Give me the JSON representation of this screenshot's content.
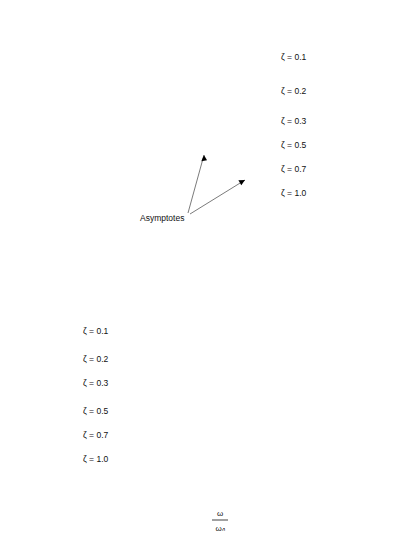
{
  "figure": {
    "kind": "bode-plot",
    "background_color": "#ffffff",
    "curve_color": "#000000",
    "grid_color": "#5a5a5a",
    "frame_color": "#1a1a1a"
  },
  "magnitude_axis": {
    "label": "db",
    "tick_labels": [
      "20",
      "10",
      "0",
      "-10"
    ],
    "tick_values": [
      20,
      10,
      0,
      -10
    ],
    "grid_values": [
      20,
      15,
      10,
      5,
      0,
      -5,
      -10,
      -15,
      -20
    ],
    "range": [
      -20,
      20
    ]
  },
  "phase_axis": {
    "label": "ϕ",
    "tick_labels": [
      "0°",
      "-90°",
      "-180°"
    ],
    "tick_values": [
      0,
      -90,
      -180
    ],
    "grid_values": [
      0,
      -30,
      -60,
      -90,
      -120,
      -150,
      -180,
      -210
    ],
    "range": [
      -270,
      0
    ]
  },
  "x_axis": {
    "title_numerator": "ω",
    "title_denominator": "ωₙ",
    "tick_labels": [
      "0.1",
      "0.2",
      "0.4",
      "0.6",
      "0.8",
      "1",
      "2",
      "4",
      "6",
      "8",
      "10"
    ],
    "tick_values": [
      0.1,
      0.2,
      0.4,
      0.6,
      0.8,
      1,
      2,
      4,
      6,
      8,
      10
    ],
    "grid_values": [
      0.1,
      0.2,
      0.4,
      0.6,
      0.8,
      1,
      2,
      4,
      6,
      8,
      10
    ],
    "range": [
      0.1,
      10
    ],
    "scale": "log"
  },
  "magnitude_legend": [
    {
      "label": "ζ = 0.1",
      "zeta": 0.1
    },
    {
      "label": "ζ = 0.2",
      "zeta": 0.2
    },
    {
      "label": "ζ = 0.3",
      "zeta": 0.3
    },
    {
      "label": "ζ = 0.5",
      "zeta": 0.5
    },
    {
      "label": "ζ = 0.7",
      "zeta": 0.7
    },
    {
      "label": "ζ = 1.0",
      "zeta": 1.0
    }
  ],
  "phase_legend": [
    {
      "label": "ζ = 0.1",
      "zeta": 0.1
    },
    {
      "label": "ζ = 0.2",
      "zeta": 0.2
    },
    {
      "label": "ζ = 0.3",
      "zeta": 0.3
    },
    {
      "label": "ζ = 0.5",
      "zeta": 0.5
    },
    {
      "label": "ζ = 0.7",
      "zeta": 0.7
    },
    {
      "label": "ζ = 1.0",
      "zeta": 1.0
    }
  ],
  "annotations": {
    "asymptotes_label": "Asymptotes"
  },
  "chart_data": {
    "type": "line",
    "title": "",
    "subtitle": "",
    "xlabel": "ω/ωₙ",
    "ylabel": "db",
    "xscale": "log",
    "xlim": [
      0.1,
      10
    ],
    "grid": true,
    "legend_position": "inside-right",
    "panels": [
      {
        "name": "magnitude",
        "ylabel": "db",
        "ylim": [
          -20,
          20
        ],
        "yticks": [
          20,
          10,
          0,
          -10
        ],
        "ygrid": [
          20,
          15,
          10,
          5,
          0,
          -5,
          -10,
          -15,
          -20
        ],
        "x": [
          0.1,
          0.15,
          0.2,
          0.3,
          0.4,
          0.5,
          0.6,
          0.7,
          0.8,
          0.9,
          0.95,
          1.0,
          1.05,
          1.1,
          1.2,
          1.4,
          1.6,
          2.0,
          2.5,
          3.0,
          4.0,
          5.0,
          6.0,
          8.0,
          10.0
        ],
        "series": [
          {
            "name": "ζ = 0.1",
            "zeta": 0.1,
            "peak_db": 14.0,
            "peak_x": 0.99,
            "values": [
              0.09,
              0.2,
              0.35,
              0.86,
              1.6,
              2.6,
              4.1,
              6.4,
              9.5,
              13.2,
              14.0,
              13.98,
              13.0,
              11.4,
              8.2,
              4.0,
              1.1,
              -3.3,
              -7.6,
              -10.7,
              -15.2,
              -18.4,
              -20.9,
              -24.5,
              -27.2
            ]
          },
          {
            "name": "ζ = 0.2",
            "zeta": 0.2,
            "peak_db": 8.1,
            "peak_x": 0.96,
            "values": [
              0.08,
              0.19,
              0.33,
              0.8,
              1.5,
              2.4,
              3.6,
              5.2,
              6.9,
              7.9,
              8.1,
              7.96,
              7.5,
              6.8,
              5.3,
              2.6,
              0.3,
              -3.6,
              -7.7,
              -10.7,
              -15.2,
              -18.4,
              -20.8,
              -24.5,
              -27.2
            ]
          },
          {
            "name": "ζ = 0.3",
            "zeta": 0.3,
            "peak_db": 4.8,
            "peak_x": 0.91,
            "values": [
              0.07,
              0.17,
              0.3,
              0.73,
              1.35,
              2.1,
              3.0,
              4.0,
              4.6,
              4.8,
              4.75,
              4.44,
              4.0,
              3.5,
              2.4,
              0.4,
              -1.5,
              -5.0,
              -8.5,
              -11.3,
              -15.6,
              -18.7,
              -21.1,
              -24.6,
              -27.3
            ]
          },
          {
            "name": "ζ = 0.5",
            "zeta": 0.5,
            "peak_db": 1.25,
            "peak_x": 0.71,
            "values": [
              0.04,
              0.11,
              0.2,
              0.5,
              0.9,
              1.1,
              1.25,
              1.2,
              1.0,
              0.6,
              0.35,
              0.0,
              -0.4,
              -0.9,
              -1.9,
              -3.8,
              -5.6,
              -8.6,
              -11.6,
              -14.0,
              -17.8,
              -20.7,
              -23.0,
              -26.3,
              -28.9
            ]
          },
          {
            "name": "ζ = 0.7",
            "zeta": 0.7,
            "peak_db": 0.0,
            "peak_x": 0.1,
            "values": [
              0.0,
              0.0,
              -0.02,
              -0.1,
              -0.25,
              -0.5,
              -0.85,
              -1.3,
              -1.9,
              -2.6,
              -2.9,
              -3.1,
              -3.5,
              -4.0,
              -4.9,
              -6.7,
              -8.3,
              -11.1,
              -13.9,
              -16.2,
              -19.8,
              -22.6,
              -24.9,
              -28.1,
              -30.7
            ]
          },
          {
            "name": "ζ = 1.0",
            "zeta": 1.0,
            "peak_db": 0.0,
            "peak_x": 0.1,
            "values": [
              -0.09,
              -0.19,
              -0.34,
              -0.75,
              -1.3,
              -1.9,
              -2.7,
              -3.5,
              -4.3,
              -5.2,
              -5.6,
              -6.0,
              -6.4,
              -6.9,
              -7.8,
              -9.6,
              -11.2,
              -13.9,
              -16.6,
              -18.8,
              -22.3,
              -25.0,
              -27.2,
              -30.4,
              -32.9
            ]
          }
        ],
        "asymptotes": [
          {
            "name": "low-frequency-asymptote",
            "points": [
              [
                0.1,
                0
              ],
              [
                1.0,
                0
              ]
            ],
            "slope_db_per_decade": 0
          },
          {
            "name": "high-frequency-asymptote",
            "points": [
              [
                1.0,
                0
              ],
              [
                10.0,
                -40
              ]
            ],
            "slope_db_per_decade": -40
          }
        ],
        "annotation": "Asymptotes"
      },
      {
        "name": "phase",
        "ylabel": "ϕ",
        "ylim": [
          -270,
          0
        ],
        "yticks": [
          0,
          -90,
          -180
        ],
        "ygrid": [
          0,
          -30,
          -60,
          -90,
          -120,
          -150,
          -180,
          -210
        ],
        "x": [
          0.1,
          0.15,
          0.2,
          0.3,
          0.4,
          0.5,
          0.6,
          0.7,
          0.8,
          0.9,
          0.95,
          1.0,
          1.05,
          1.1,
          1.2,
          1.4,
          1.6,
          2.0,
          2.5,
          3.0,
          4.0,
          5.0,
          6.0,
          8.0,
          10.0
        ],
        "series": [
          {
            "name": "ζ = 0.1",
            "zeta": 0.1,
            "values": [
              -1.2,
              -1.8,
              -2.4,
              -4.0,
              -5.4,
              -7.6,
              -10.7,
              -15.8,
              -26.6,
              -46.4,
              -63.7,
              -90.0,
              -114.2,
              -133.0,
              -155.4,
              -168.6,
              -173.2,
              -176.2,
              -177.9,
              -178.6,
              -179.2,
              -179.5,
              -179.6,
              -179.8,
              -179.9
            ]
          },
          {
            "name": "ζ = 0.2",
            "zeta": 0.2,
            "values": [
              -2.3,
              -3.5,
              -4.8,
              -7.5,
              -10.8,
              -15.2,
              -21.3,
              -30.5,
              -45.0,
              -64.6,
              -76.0,
              -90.0,
              -103.1,
              -114.6,
              -136.4,
              -157.4,
              -165.0,
              -172.4,
              -175.8,
              -177.1,
              -178.5,
              -179.0,
              -179.2,
              -179.5,
              -179.7
            ]
          },
          {
            "name": "ζ = 0.3",
            "zeta": 0.3,
            "values": [
              -3.5,
              -5.2,
              -7.2,
              -11.3,
              -16.3,
              -22.6,
              -31.0,
              -42.3,
              -56.9,
              -72.4,
              -80.9,
              -90.0,
              -98.5,
              -107.1,
              -126.9,
              -148.8,
              -158.4,
              -168.7,
              -173.5,
              -175.6,
              -177.5,
              -178.3,
              -178.7,
              -179.2,
              -179.4
            ]
          },
          {
            "name": "ζ = 0.5",
            "zeta": 0.5,
            "values": [
              -5.8,
              -8.7,
              -11.9,
              -18.8,
              -27.0,
              -36.9,
              -48.9,
              -62.9,
              -77.3,
              -86.2,
              -88.2,
              -90.0,
              -96.3,
              -105.3,
              -124.6,
              -145.5,
              -155.8,
              -167.3,
              -172.6,
              -174.9,
              -177.1,
              -178.0,
              -178.5,
              -179.0,
              -179.2
            ]
          },
          {
            "name": "ζ = 0.7",
            "zeta": 0.7,
            "values": [
              -8.1,
              -12.1,
              -16.6,
              -26.1,
              -37.0,
              -49.8,
              -64.2,
              -79.1,
              -88.5,
              -89.8,
              -90.0,
              -90.0,
              -93.9,
              -102.9,
              -121.3,
              -142.0,
              -152.8,
              -165.5,
              -171.3,
              -174.0,
              -176.5,
              -177.6,
              -178.2,
              -178.8,
              -179.1
            ]
          },
          {
            "name": "ζ = 1.0",
            "zeta": 1.0,
            "values": [
              -11.4,
              -17.1,
              -22.6,
              -33.4,
              -43.6,
              -53.1,
              -61.9,
              -69.9,
              -77.3,
              -83.9,
              -87.0,
              -90.0,
              -92.9,
              -95.6,
              -112.6,
              -134.8,
              -147.2,
              -161.1,
              -168.1,
              -171.3,
              -174.8,
              -176.4,
              -177.3,
              -178.2,
              -178.6
            ]
          }
        ]
      }
    ]
  }
}
